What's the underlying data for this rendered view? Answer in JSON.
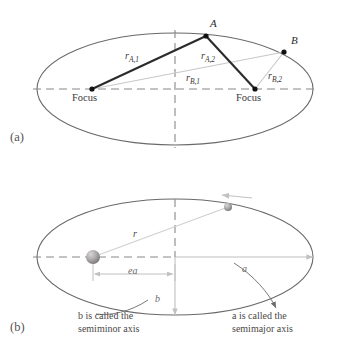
{
  "figure": {
    "width": 337,
    "height": 339,
    "colors": {
      "ellipse_stroke": "#6b6868",
      "dashed_axis": "#8a8787",
      "solid_dark_line": "#2b2b2b",
      "light_gray_line": "#c9c7c7",
      "text": "#2b2b2b",
      "muted_text": "#5a5757",
      "sphere_gray": "#9a9898"
    }
  },
  "panel_a": {
    "tag": "(a)",
    "points": [
      {
        "name": "point-a",
        "label": "A",
        "x": 206,
        "y": 36
      },
      {
        "name": "point-b",
        "label": "B",
        "x": 284,
        "y": 52
      }
    ],
    "foci": [
      {
        "name": "focus-left",
        "label": "Focus",
        "x": 92,
        "y": 89
      },
      {
        "name": "focus-right",
        "label": "Focus",
        "x": 255,
        "y": 89
      }
    ],
    "radii": [
      {
        "name": "r-a-1",
        "base": "r",
        "sub": "A,1",
        "from": "focus-left",
        "to": "point-a",
        "style": "dark"
      },
      {
        "name": "r-a-2",
        "base": "r",
        "sub": "A,2",
        "from": "focus-right",
        "to": "point-a",
        "style": "dark"
      },
      {
        "name": "r-b-1",
        "base": "r",
        "sub": "B,1",
        "from": "focus-left",
        "to": "point-b",
        "style": "light"
      },
      {
        "name": "r-b-2",
        "base": "r",
        "sub": "B,2",
        "from": "focus-right",
        "to": "point-b",
        "style": "light"
      }
    ],
    "ellipse": {
      "cx": 175,
      "cy": 89,
      "rx": 138,
      "ry": 56
    }
  },
  "panel_b": {
    "tag": "(b)",
    "ellipse": {
      "cx": 175,
      "cy": 257,
      "rx": 138,
      "ry": 58
    },
    "sun": {
      "name": "sun-sphere",
      "x": 93,
      "y": 257,
      "r": 7
    },
    "planet": {
      "name": "planet-sphere",
      "x": 228,
      "y": 207,
      "r": 4
    },
    "labels": {
      "radius": "r",
      "focal_distance": "ea",
      "semimajor": "a",
      "semiminor": "b"
    },
    "captions": {
      "semiminor_line1": "b is called the",
      "semiminor_line2": "semiminor axis",
      "semimajor_line1": "a is called the",
      "semimajor_line2": "semimajor axis"
    },
    "direction_arrow": {
      "name": "orbit-direction-arrow",
      "points": "left"
    }
  }
}
